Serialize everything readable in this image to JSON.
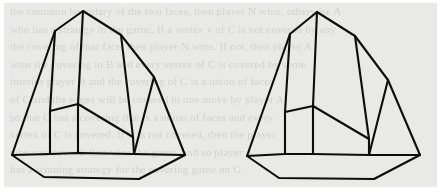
{
  "page": {
    "kind": "scanned-book-page-figure",
    "background_color": "#e9e9e7",
    "margin_color": "#ffffff",
    "ink_color": "#0d0d0d",
    "bleed_color": "#8a7b72"
  },
  "bleed_through": {
    "description": "faint illegible show-through text from reverse side of page",
    "lines": [
      "the common boundary of the two faces, then player N wins; otherwise A",
      "who has a strategy in the game. If a vertex v of C is not covered by any",
      "the covering of that face, then player N wins. If not, then player A",
      "wins the covering in B and every vertex of C is covered by some",
      "interior player B and the covering of C is a union of faces",
      "of C and the edges will be covered in one move by player A,",
      "so that C has a covering that is a union of faces and every",
      "vertex of C is covered. If C is not covered, then the player",
      "who can cover it first wins the game, and so player A",
      "has a winning strategy for the covering game on C."
    ]
  },
  "figures": [
    {
      "id": "left-polyhedron",
      "label": "left-polyhedron-wireframe",
      "type": "convex-polyhedron-wireframe",
      "vertices": {
        "apex": [
          79,
          8
        ],
        "upper_left": [
          51,
          28
        ],
        "upper_right": [
          117,
          32
        ],
        "far_right": [
          150,
          74
        ],
        "mid_left": [
          46,
          108
        ],
        "mid_center": [
          74,
          101
        ],
        "mid_right": [
          129,
          134
        ],
        "base_left": [
          8,
          152
        ],
        "base_bl": [
          40,
          174
        ],
        "base_bottom": [
          135,
          176
        ],
        "base_br": [
          178,
          152
        ],
        "base_right": [
          181,
          152
        ],
        "inner_left": [
          48,
          150
        ],
        "inner_mid": [
          130,
          151
        ]
      },
      "outline": "M 79 8 L 51 28 L 8 152 L 40 174 L 135 176 L 181 152 L 150 74 L 117 32 Z",
      "edges": [
        "apex-to-upper_left",
        "apex-to-upper_right",
        "apex-to-inner_vertical",
        "upper_left-to-mid_left",
        "upper_right-to-far_right",
        "upper_right-to-mid_right",
        "far_right-to-base_right",
        "mid_left-to-mid_center",
        "mid_center-to-mid_right",
        "base_left-to-inner_left",
        "inner_left-to-inner_mid",
        "inner_mid-to-base_right",
        "base_left-to-base_bl",
        "base_bl-to-base_bottom",
        "base_bottom-to-base_right"
      ]
    },
    {
      "id": "right-polyhedron",
      "label": "right-polyhedron-wireframe",
      "type": "convex-polyhedron-wireframe",
      "vertices": {
        "apex": [
          313,
          9
        ],
        "upper_left": [
          286,
          31
        ],
        "upper_right": [
          351,
          33
        ],
        "far_right": [
          384,
          77
        ],
        "mid_left": [
          281,
          109
        ],
        "mid_center": [
          309,
          103
        ],
        "mid_right": [
          365,
          136
        ],
        "base_left": [
          243,
          153
        ],
        "base_bl": [
          275,
          175
        ],
        "base_bottom": [
          370,
          176
        ],
        "base_right": [
          416,
          152
        ],
        "inner_left": [
          283,
          151
        ],
        "inner_mid": [
          365,
          152
        ]
      },
      "outline": "M 313 9 L 286 31 L 243 153 L 275 175 L 370 176 L 416 152 L 384 77 L 351 33 Z"
    }
  ]
}
